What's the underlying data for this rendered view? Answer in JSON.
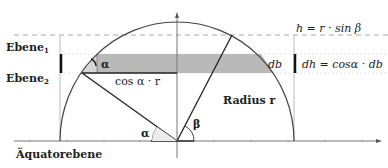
{
  "labels": {
    "ebene1": "Ebene",
    "ebene1_sub": "1",
    "ebene2": "Ebene",
    "ebene2_sub": "2",
    "equator": "Äquatorebene",
    "radius": "Radius r",
    "cos_alpha_r": "cos α · r",
    "db": "db",
    "h_formula": "h = r · sin β",
    "dh_formula": "dh = cosα · db",
    "alpha_top": "α",
    "alpha_bottom": "α",
    "beta": "β"
  },
  "colors": {
    "band_dark": "#b8b8b8",
    "band_light": "#d4d4d4",
    "stroke": "#333333",
    "guide": "#bbbbbb"
  }
}
